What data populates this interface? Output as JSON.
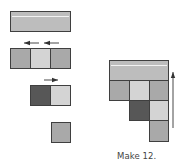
{
  "colors": {
    "bar": "#bdbdbd",
    "medium": "#a9a9a9",
    "light": "#d4d4d4",
    "dark": "#575757",
    "border": "#3f3f3f",
    "arrow": "#333333"
  },
  "left_column": {
    "ten_bar": {
      "x": 10,
      "y": 11,
      "w": 61,
      "h": 21
    },
    "row_three": {
      "arrows": [
        {
          "x1": 39,
          "x2": 24,
          "y": 43,
          "direction": "left"
        },
        {
          "x1": 59,
          "x2": 44,
          "y": 43,
          "direction": "left"
        }
      ],
      "blocks": [
        {
          "x": 10,
          "y": 48,
          "w": 21,
          "h": 21,
          "shade": "medium"
        },
        {
          "x": 30,
          "y": 48,
          "w": 21,
          "h": 21,
          "shade": "light"
        },
        {
          "x": 50,
          "y": 48,
          "w": 21,
          "h": 21,
          "shade": "medium"
        }
      ]
    },
    "row_two": {
      "arrows": [
        {
          "x1": 44,
          "x2": 58,
          "y": 80,
          "direction": "right"
        }
      ],
      "blocks": [
        {
          "x": 30,
          "y": 85,
          "w": 21,
          "h": 21,
          "shade": "dark"
        },
        {
          "x": 50,
          "y": 85,
          "w": 21,
          "h": 21,
          "shade": "light"
        }
      ]
    },
    "row_one": {
      "blocks": [
        {
          "x": 51,
          "y": 122,
          "w": 20,
          "h": 21,
          "shade": "medium"
        }
      ]
    }
  },
  "right_stack": {
    "ten_bar": {
      "x": 109,
      "y": 60,
      "w": 60,
      "h": 21
    },
    "blocks": [
      {
        "x": 109,
        "y": 80,
        "w": 21,
        "h": 21,
        "shade": "medium"
      },
      {
        "x": 129,
        "y": 80,
        "w": 21,
        "h": 21,
        "shade": "light"
      },
      {
        "x": 149,
        "y": 80,
        "w": 20,
        "h": 21,
        "shade": "medium"
      },
      {
        "x": 129,
        "y": 100,
        "w": 21,
        "h": 21,
        "shade": "dark"
      },
      {
        "x": 149,
        "y": 100,
        "w": 20,
        "h": 21,
        "shade": "light"
      },
      {
        "x": 149,
        "y": 120,
        "w": 20,
        "h": 22,
        "shade": "medium"
      }
    ],
    "arrow": {
      "x": 173,
      "y1": 128,
      "y2": 72,
      "direction": "up"
    }
  },
  "caption": {
    "text": "Make 12.",
    "x": 117,
    "y": 151
  }
}
